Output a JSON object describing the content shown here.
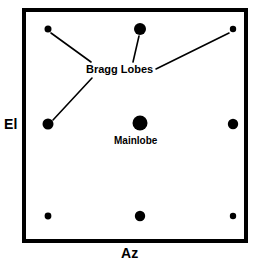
{
  "figure": {
    "type": "antenna-pattern-diagram",
    "background_color": "#ffffff",
    "ink_color": "#000000",
    "frame": {
      "x": 22,
      "y": 8,
      "width": 226,
      "height": 235,
      "border_width": 4,
      "border_color": "#000000",
      "fill": "#ffffff"
    }
  },
  "axes": {
    "vertical": {
      "label": "El",
      "name": "elevation-axis-label"
    },
    "horizontal": {
      "label": "Az",
      "name": "azimuth-axis-label"
    }
  },
  "annotations": [
    {
      "id": "bragg-lobes",
      "text": "Bragg Lobes",
      "x": 86,
      "y": 64,
      "font_size": 11
    },
    {
      "id": "mainlobe",
      "text": "Mainlobe",
      "x": 114,
      "y": 136,
      "font_size": 10
    }
  ],
  "chart_data": {
    "type": "scatter",
    "title": "",
    "xlabel": "Az",
    "ylabel": "El",
    "grid": false,
    "legend": "none",
    "xlim": [
      22,
      248
    ],
    "ylim": [
      8,
      243
    ],
    "point_color": "#000000",
    "series": [
      {
        "name": "Mainlobe",
        "values": [
          {
            "id": "mainlobe-dot",
            "x": 140,
            "y": 123,
            "r": 7.5,
            "role": "mainlobe"
          }
        ]
      },
      {
        "name": "Bragg Lobes",
        "values": [
          {
            "id": "lobe-top-left",
            "x": 48,
            "y": 29,
            "r": 3.5,
            "role": "bragg-lobe"
          },
          {
            "id": "lobe-top-center",
            "x": 140,
            "y": 29,
            "r": 6.0,
            "role": "bragg-lobe"
          },
          {
            "id": "lobe-top-right",
            "x": 233,
            "y": 29,
            "r": 3.2,
            "role": "bragg-lobe"
          },
          {
            "id": "lobe-mid-left",
            "x": 48,
            "y": 124,
            "r": 5.5,
            "role": "bragg-lobe"
          },
          {
            "id": "lobe-mid-right",
            "x": 233,
            "y": 124,
            "r": 5.2,
            "role": "bragg-lobe"
          },
          {
            "id": "lobe-bottom-left",
            "x": 48,
            "y": 216,
            "r": 3.4,
            "role": "bragg-lobe"
          },
          {
            "id": "lobe-bottom-center",
            "x": 140,
            "y": 216,
            "r": 5.2,
            "role": "bragg-lobe"
          },
          {
            "id": "lobe-bottom-right",
            "x": 233,
            "y": 216,
            "r": 3.2,
            "role": "bragg-lobe"
          }
        ]
      }
    ],
    "leader_lines": [
      {
        "id": "leader-to-top-left",
        "x1": 91,
        "y1": 62,
        "x2": 51,
        "y2": 33,
        "target": "lobe-top-left"
      },
      {
        "id": "leader-to-top-center",
        "x1": 133,
        "y1": 62,
        "x2": 139,
        "y2": 36,
        "target": "lobe-top-center"
      },
      {
        "id": "leader-to-top-right",
        "x1": 156,
        "y1": 69,
        "x2": 229,
        "y2": 33,
        "target": "lobe-top-right"
      },
      {
        "id": "leader-to-mid-left",
        "x1": 92,
        "y1": 78,
        "x2": 53,
        "y2": 120,
        "target": "lobe-mid-left"
      }
    ]
  }
}
